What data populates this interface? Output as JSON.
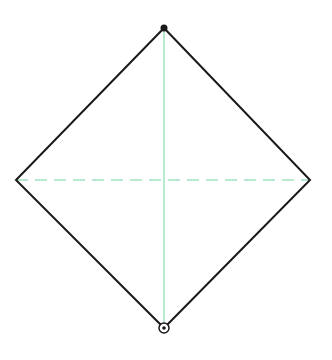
{
  "diagram": {
    "type": "rhombus-with-diagonals",
    "canvas": {
      "width": 332,
      "height": 360,
      "background": "#ffffff"
    },
    "vertices": {
      "top": {
        "x": 164,
        "y": 28,
        "marker": "filled-dot"
      },
      "right": {
        "x": 310,
        "y": 180,
        "marker": "none"
      },
      "bottom": {
        "x": 164,
        "y": 328,
        "marker": "open-circle-with-dot"
      },
      "left": {
        "x": 16,
        "y": 180,
        "marker": "none"
      }
    },
    "outline": {
      "color": "#1a1a1a",
      "width": 2
    },
    "diagonals": {
      "vertical": {
        "color": "#6fd3a0",
        "width": 1,
        "style": "solid"
      },
      "horizontal": {
        "color": "#6fd3a0",
        "width": 1,
        "style": "dashed",
        "dash": "12 7"
      }
    }
  }
}
